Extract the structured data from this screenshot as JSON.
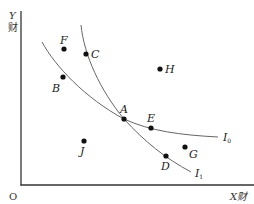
{
  "diagram": {
    "type": "indifference-curves",
    "origin_label": "O",
    "y_axis": {
      "label_line1": "Y",
      "label_line2": "财"
    },
    "x_axis": {
      "label": "X财"
    },
    "curves": [
      {
        "id": "I0",
        "label": "I",
        "subscript": "0"
      },
      {
        "id": "I1",
        "label": "I",
        "subscript": "1"
      }
    ],
    "points": {
      "A": "A",
      "B": "B",
      "C": "C",
      "D": "D",
      "E": "E",
      "F": "F",
      "G": "G",
      "H": "H",
      "J": "J"
    }
  }
}
